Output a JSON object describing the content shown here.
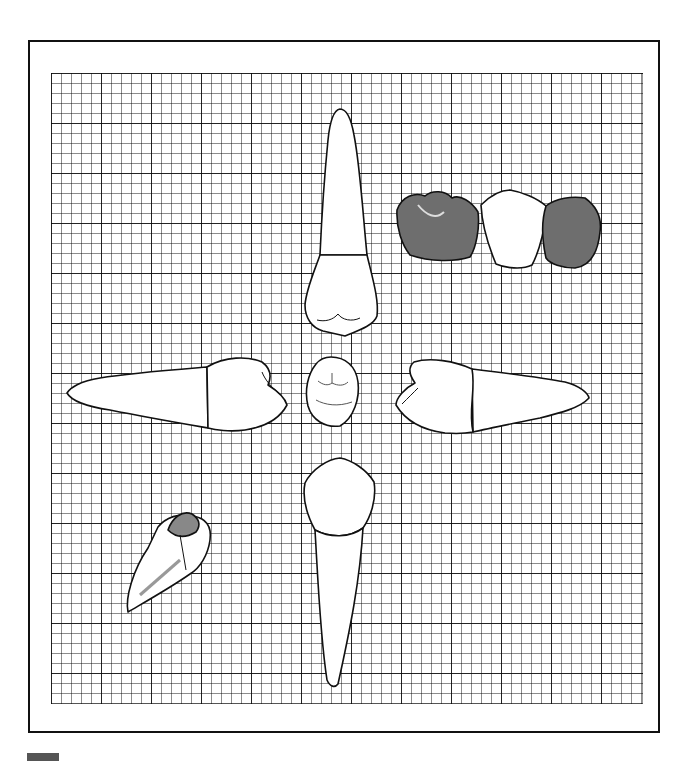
{
  "figure": {
    "grid": {
      "minor_cell_px": 10,
      "major_every": 5,
      "line_color": "#333333"
    },
    "views": [
      {
        "id": "top",
        "name": "Labial/buccal view (root up)"
      },
      {
        "id": "left",
        "name": "Proximal view (root left)"
      },
      {
        "id": "center",
        "name": "Occlusal view"
      },
      {
        "id": "right",
        "name": "Proximal view (root right)"
      },
      {
        "id": "bottom",
        "name": "Lingual view (root down)"
      },
      {
        "id": "arch",
        "name": "Contact with adjacent teeth"
      },
      {
        "id": "inset",
        "name": "Orientation inset"
      }
    ],
    "colors": {
      "outline": "#111111",
      "shade": "#6e6e6e",
      "paper": "#ffffff"
    }
  }
}
